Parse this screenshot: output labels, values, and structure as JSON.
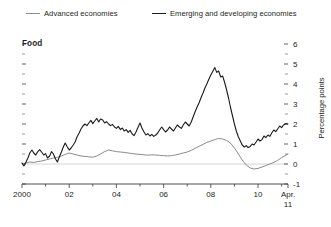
{
  "legend": {
    "position": "top",
    "items": [
      {
        "label": "Advanced economies",
        "color": "#8b8b8b",
        "key": "advanced"
      },
      {
        "label": "Emerging and developing economies",
        "color": "#1a1a1a",
        "key": "emerging"
      }
    ]
  },
  "chart_data": {
    "type": "line",
    "title": "Food",
    "xlabel": "",
    "ylabel": "Percentage points",
    "ylim": [
      -1,
      6
    ],
    "xlim": [
      2000,
      2011.27
    ],
    "grid": false,
    "zero_line": true,
    "y_ticks": [
      -1,
      0,
      1,
      2,
      3,
      4,
      5,
      6
    ],
    "y_tick_labels": [
      "-1",
      "0",
      "1",
      "2",
      "3",
      "4",
      "5",
      "6"
    ],
    "y_minor_ticks": [
      -0.5,
      0.5,
      1.5,
      2.5,
      3.5,
      4.5,
      5.5
    ],
    "x_ticks": [
      2000,
      2002,
      2004,
      2006,
      2008,
      2010,
      2011.27
    ],
    "x_tick_labels": [
      "2000",
      "02",
      "04",
      "06",
      "08",
      "10",
      "Apr."
    ],
    "x_tick_sublabel": "11",
    "axis_side": "right",
    "series": [
      {
        "name": "Advanced economies",
        "color": "#8b8b8b",
        "width": 1.0,
        "points": [
          [
            2000.0,
            0.02
          ],
          [
            2000.17,
            0.05
          ],
          [
            2000.33,
            0.1
          ],
          [
            2000.5,
            0.08
          ],
          [
            2000.67,
            0.12
          ],
          [
            2000.83,
            0.15
          ],
          [
            2001.0,
            0.2
          ],
          [
            2001.17,
            0.25
          ],
          [
            2001.33,
            0.3
          ],
          [
            2001.5,
            0.33
          ],
          [
            2001.67,
            0.4
          ],
          [
            2001.83,
            0.48
          ],
          [
            2002.0,
            0.55
          ],
          [
            2002.17,
            0.5
          ],
          [
            2002.33,
            0.45
          ],
          [
            2002.5,
            0.4
          ],
          [
            2002.67,
            0.38
          ],
          [
            2002.83,
            0.36
          ],
          [
            2003.0,
            0.34
          ],
          [
            2003.17,
            0.4
          ],
          [
            2003.33,
            0.5
          ],
          [
            2003.5,
            0.62
          ],
          [
            2003.67,
            0.7
          ],
          [
            2003.83,
            0.66
          ],
          [
            2004.0,
            0.62
          ],
          [
            2004.17,
            0.6
          ],
          [
            2004.33,
            0.58
          ],
          [
            2004.5,
            0.55
          ],
          [
            2004.67,
            0.52
          ],
          [
            2004.83,
            0.5
          ],
          [
            2005.0,
            0.48
          ],
          [
            2005.17,
            0.46
          ],
          [
            2005.33,
            0.44
          ],
          [
            2005.5,
            0.46
          ],
          [
            2005.67,
            0.45
          ],
          [
            2005.83,
            0.43
          ],
          [
            2006.0,
            0.42
          ],
          [
            2006.17,
            0.4
          ],
          [
            2006.33,
            0.42
          ],
          [
            2006.5,
            0.45
          ],
          [
            2006.67,
            0.5
          ],
          [
            2006.83,
            0.55
          ],
          [
            2007.0,
            0.6
          ],
          [
            2007.17,
            0.68
          ],
          [
            2007.33,
            0.78
          ],
          [
            2007.5,
            0.88
          ],
          [
            2007.67,
            0.98
          ],
          [
            2007.83,
            1.08
          ],
          [
            2008.0,
            1.15
          ],
          [
            2008.17,
            1.22
          ],
          [
            2008.33,
            1.28
          ],
          [
            2008.5,
            1.25
          ],
          [
            2008.67,
            1.18
          ],
          [
            2008.83,
            1.05
          ],
          [
            2009.0,
            0.8
          ],
          [
            2009.17,
            0.5
          ],
          [
            2009.33,
            0.2
          ],
          [
            2009.5,
            -0.05
          ],
          [
            2009.67,
            -0.2
          ],
          [
            2009.83,
            -0.25
          ],
          [
            2010.0,
            -0.22
          ],
          [
            2010.17,
            -0.15
          ],
          [
            2010.33,
            -0.08
          ],
          [
            2010.5,
            0.0
          ],
          [
            2010.67,
            0.08
          ],
          [
            2010.83,
            0.18
          ],
          [
            2011.0,
            0.32
          ],
          [
            2011.27,
            0.5
          ]
        ]
      },
      {
        "name": "Emerging and developing economies",
        "color": "#1a1a1a",
        "width": 1.1,
        "points": [
          [
            2000.0,
            0.05
          ],
          [
            2000.08,
            -0.1
          ],
          [
            2000.17,
            0.1
          ],
          [
            2000.25,
            0.3
          ],
          [
            2000.33,
            0.55
          ],
          [
            2000.42,
            0.7
          ],
          [
            2000.5,
            0.55
          ],
          [
            2000.58,
            0.45
          ],
          [
            2000.67,
            0.62
          ],
          [
            2000.75,
            0.72
          ],
          [
            2000.83,
            0.6
          ],
          [
            2000.92,
            0.45
          ],
          [
            2001.0,
            0.52
          ],
          [
            2001.08,
            0.3
          ],
          [
            2001.17,
            0.4
          ],
          [
            2001.25,
            0.62
          ],
          [
            2001.33,
            0.5
          ],
          [
            2001.42,
            0.25
          ],
          [
            2001.5,
            0.1
          ],
          [
            2001.58,
            0.35
          ],
          [
            2001.67,
            0.6
          ],
          [
            2001.75,
            0.85
          ],
          [
            2001.83,
            1.05
          ],
          [
            2001.92,
            0.85
          ],
          [
            2002.0,
            0.7
          ],
          [
            2002.08,
            0.8
          ],
          [
            2002.17,
            0.95
          ],
          [
            2002.25,
            1.1
          ],
          [
            2002.33,
            1.35
          ],
          [
            2002.42,
            1.55
          ],
          [
            2002.5,
            1.75
          ],
          [
            2002.58,
            1.9
          ],
          [
            2002.67,
            2.0
          ],
          [
            2002.75,
            1.92
          ],
          [
            2002.83,
            2.05
          ],
          [
            2002.92,
            2.18
          ],
          [
            2003.0,
            2.02
          ],
          [
            2003.08,
            2.15
          ],
          [
            2003.17,
            2.28
          ],
          [
            2003.25,
            2.1
          ],
          [
            2003.33,
            2.25
          ],
          [
            2003.42,
            2.2
          ],
          [
            2003.5,
            2.05
          ],
          [
            2003.58,
            2.12
          ],
          [
            2003.67,
            2.0
          ],
          [
            2003.75,
            1.92
          ],
          [
            2003.83,
            1.98
          ],
          [
            2003.92,
            1.85
          ],
          [
            2004.0,
            1.78
          ],
          [
            2004.08,
            1.88
          ],
          [
            2004.17,
            1.72
          ],
          [
            2004.25,
            1.8
          ],
          [
            2004.33,
            1.65
          ],
          [
            2004.42,
            1.72
          ],
          [
            2004.5,
            1.58
          ],
          [
            2004.58,
            1.68
          ],
          [
            2004.67,
            1.5
          ],
          [
            2004.75,
            1.42
          ],
          [
            2004.83,
            1.6
          ],
          [
            2004.92,
            1.85
          ],
          [
            2005.0,
            2.05
          ],
          [
            2005.08,
            1.8
          ],
          [
            2005.17,
            1.6
          ],
          [
            2005.25,
            1.45
          ],
          [
            2005.33,
            1.52
          ],
          [
            2005.42,
            1.4
          ],
          [
            2005.5,
            1.48
          ],
          [
            2005.58,
            1.38
          ],
          [
            2005.67,
            1.45
          ],
          [
            2005.75,
            1.55
          ],
          [
            2005.83,
            1.7
          ],
          [
            2005.92,
            1.85
          ],
          [
            2006.0,
            1.72
          ],
          [
            2006.08,
            1.6
          ],
          [
            2006.17,
            1.7
          ],
          [
            2006.25,
            1.85
          ],
          [
            2006.33,
            1.75
          ],
          [
            2006.42,
            1.65
          ],
          [
            2006.5,
            1.8
          ],
          [
            2006.58,
            1.95
          ],
          [
            2006.67,
            1.85
          ],
          [
            2006.75,
            1.78
          ],
          [
            2006.83,
            1.95
          ],
          [
            2006.92,
            2.1
          ],
          [
            2007.0,
            2.0
          ],
          [
            2007.08,
            1.9
          ],
          [
            2007.17,
            2.1
          ],
          [
            2007.25,
            2.35
          ],
          [
            2007.33,
            2.6
          ],
          [
            2007.42,
            2.85
          ],
          [
            2007.5,
            3.05
          ],
          [
            2007.58,
            3.3
          ],
          [
            2007.67,
            3.55
          ],
          [
            2007.75,
            3.8
          ],
          [
            2007.83,
            4.0
          ],
          [
            2007.92,
            4.25
          ],
          [
            2008.0,
            4.45
          ],
          [
            2008.08,
            4.62
          ],
          [
            2008.17,
            4.82
          ],
          [
            2008.25,
            4.58
          ],
          [
            2008.33,
            4.65
          ],
          [
            2008.42,
            4.35
          ],
          [
            2008.5,
            4.4
          ],
          [
            2008.58,
            4.1
          ],
          [
            2008.67,
            3.7
          ],
          [
            2008.75,
            3.3
          ],
          [
            2008.83,
            2.85
          ],
          [
            2008.92,
            2.4
          ],
          [
            2009.0,
            2.0
          ],
          [
            2009.08,
            1.65
          ],
          [
            2009.17,
            1.35
          ],
          [
            2009.25,
            1.15
          ],
          [
            2009.33,
            0.95
          ],
          [
            2009.42,
            0.85
          ],
          [
            2009.5,
            0.92
          ],
          [
            2009.58,
            0.82
          ],
          [
            2009.67,
            0.88
          ],
          [
            2009.75,
            1.0
          ],
          [
            2009.83,
            0.95
          ],
          [
            2009.92,
            1.1
          ],
          [
            2010.0,
            1.25
          ],
          [
            2010.08,
            1.15
          ],
          [
            2010.17,
            1.22
          ],
          [
            2010.25,
            1.4
          ],
          [
            2010.33,
            1.32
          ],
          [
            2010.42,
            1.45
          ],
          [
            2010.5,
            1.38
          ],
          [
            2010.58,
            1.55
          ],
          [
            2010.67,
            1.7
          ],
          [
            2010.75,
            1.62
          ],
          [
            2010.83,
            1.75
          ],
          [
            2010.92,
            1.9
          ],
          [
            2011.0,
            1.82
          ],
          [
            2011.08,
            1.95
          ],
          [
            2011.17,
            2.02
          ],
          [
            2011.27,
            2.0
          ]
        ]
      }
    ]
  }
}
